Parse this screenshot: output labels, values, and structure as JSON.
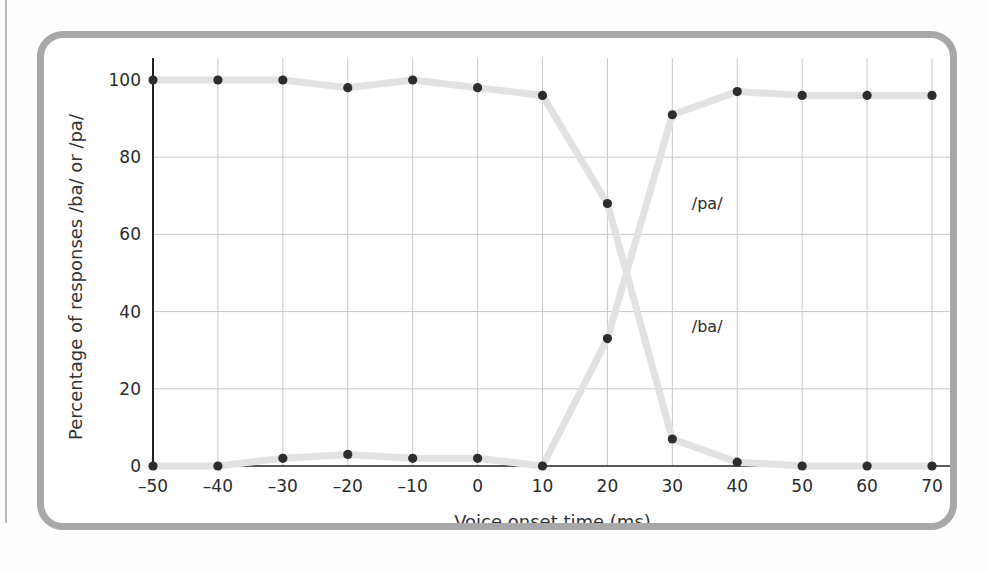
{
  "figure": {
    "frame_color": "#a8a8a8",
    "background": "#ffffff"
  },
  "chart_data": {
    "type": "line",
    "title": "",
    "subtitle": "",
    "xlabel": "Voice onset time (ms)",
    "ylabel": "Percentage of responses /ba/ or /pa/",
    "x": [
      -50,
      -40,
      -30,
      -20,
      -10,
      0,
      10,
      20,
      30,
      40,
      50,
      60,
      70
    ],
    "xticklabels": [
      "–50",
      "–40",
      "–30",
      "–20",
      "–10",
      "0",
      "10",
      "20",
      "30",
      "40",
      "50",
      "60",
      "70"
    ],
    "yticks": [
      0,
      20,
      40,
      60,
      80,
      100
    ],
    "yticklabels": [
      "0",
      "20",
      "40",
      "60",
      "80",
      "100"
    ],
    "xlim": [
      -50,
      70
    ],
    "ylim": [
      0,
      100
    ],
    "grid": true,
    "grid_color": "#c9c9c9",
    "line_color": "#e2e2e2",
    "marker_color": "#2d2d2d",
    "legend": "inline-annotations",
    "series": [
      {
        "name": "/ba/",
        "label": "/ba/",
        "label_x": 33,
        "label_y": 36,
        "values": [
          100,
          100,
          100,
          98,
          100,
          98,
          96,
          68,
          7,
          1,
          0,
          0,
          0
        ]
      },
      {
        "name": "/pa/",
        "label": "/pa/",
        "label_x": 33,
        "label_y": 68,
        "values": [
          0,
          0,
          2,
          3,
          2,
          2,
          0,
          33,
          91,
          97,
          96,
          96,
          96
        ]
      }
    ],
    "annotations": [
      {
        "text": "/pa/",
        "x": 33,
        "y": 68
      },
      {
        "text": "/ba/",
        "x": 33,
        "y": 36
      }
    ]
  }
}
